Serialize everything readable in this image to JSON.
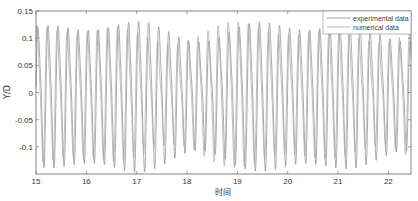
{
  "chart_data": {
    "type": "line",
    "title": "",
    "xlabel": "时间",
    "ylabel": "Y/D",
    "xlim": [
      15,
      22.45
    ],
    "ylim": [
      -0.15,
      0.15
    ],
    "xticks": [
      15,
      16,
      17,
      18,
      19,
      20,
      21,
      22
    ],
    "xtick_labels": [
      "15",
      "16",
      "17",
      "18",
      "19",
      "20",
      "21",
      "22"
    ],
    "yticks": [
      0.15,
      0.1,
      0.05,
      0,
      -0.05,
      -0.1
    ],
    "ytick_labels": [
      "0.15",
      "0.1",
      "0.05",
      "0",
      "-0.05",
      "-0.1"
    ],
    "grid": false,
    "legend": {
      "position": "top-right",
      "entries": [
        "experimental data",
        "numerical data"
      ]
    },
    "series": [
      {
        "name": "experimental data",
        "color": "#8a8a8a",
        "description": "Oscillating signal, dominant frequency ~5 per time unit, amplitude ~0.09-0.14 with beating modulation",
        "dominant_frequency": 5.0,
        "amplitude_range": [
          0.09,
          0.14
        ]
      },
      {
        "name": "numerical data",
        "color": "#a8a8a8",
        "description": "Oscillating signal, dominant frequency ~5 per time unit, amplitude ~0.08-0.13, slightly phase shifted",
        "dominant_frequency": 5.0,
        "amplitude_range": [
          0.08,
          0.13
        ]
      }
    ]
  }
}
